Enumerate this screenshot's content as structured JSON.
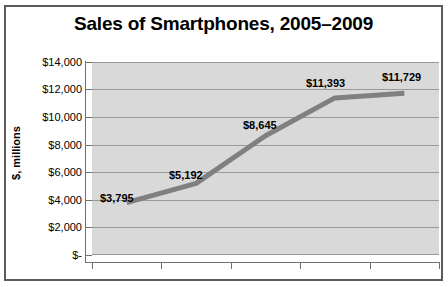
{
  "chart_data": {
    "type": "line",
    "title": "Sales of Smartphones, 2005–2009",
    "xlabel": "",
    "ylabel": "$, millions",
    "categories": [
      "",
      "",
      "",
      "",
      ""
    ],
    "values": [
      3795,
      5192,
      8645,
      11393,
      11729
    ],
    "point_labels": [
      "$3,795",
      "$5,192",
      "$8,645",
      "$11,393",
      "$11,729"
    ],
    "ylim": [
      0,
      14000
    ],
    "ytick_values": [
      14000,
      12000,
      10000,
      8000,
      6000,
      4000,
      2000,
      0
    ],
    "ytick_labels": [
      "$14,000",
      "$12,000",
      "$10,000",
      "$8,000",
      "$6,000",
      "$4,000",
      "$2,000",
      "$-"
    ],
    "xtick_labels": [],
    "grid": true,
    "legend": false,
    "series": [
      {
        "name": "Sales",
        "values": [
          3795,
          5192,
          8645,
          11393,
          11729
        ]
      }
    ],
    "colors": {
      "line": "#808080",
      "plot_background": "#d9d9d9",
      "gridline": "#9a9a9a",
      "axis": "#6f6f6f",
      "border": "#5b5b5b",
      "text": "#000000",
      "figure_background": "#ffffff"
    }
  }
}
